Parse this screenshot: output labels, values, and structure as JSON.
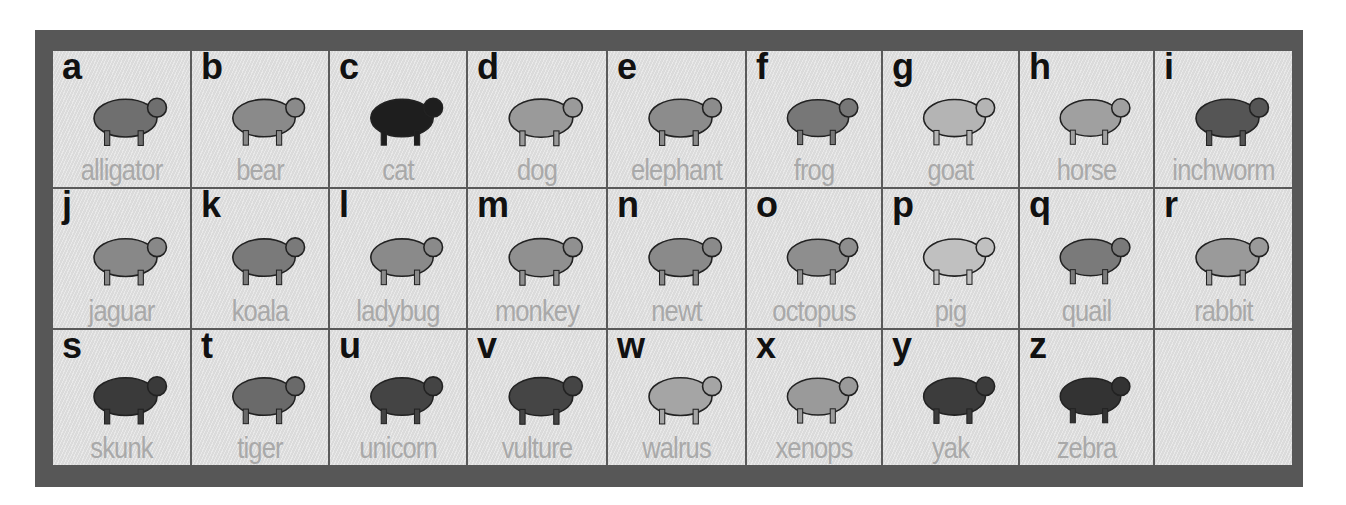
{
  "chart_title": "Animal Alphabet",
  "colors": {
    "frame": "#575757",
    "cell_background": "#e2e2e2",
    "letter": "#111111",
    "word": "#a9a9a9"
  },
  "cells": [
    {
      "letter": "a",
      "word": "alligator",
      "icon": "alligator-icon",
      "tone": "#6f6f6f"
    },
    {
      "letter": "b",
      "word": "bear",
      "icon": "bear-icon",
      "tone": "#8a8a8a"
    },
    {
      "letter": "c",
      "word": "cat",
      "icon": "cat-icon",
      "tone": "#1e1e1e"
    },
    {
      "letter": "d",
      "word": "dog",
      "icon": "dog-icon",
      "tone": "#9a9a9a"
    },
    {
      "letter": "e",
      "word": "elephant",
      "icon": "elephant-icon",
      "tone": "#8c8c8c"
    },
    {
      "letter": "f",
      "word": "frog",
      "icon": "frog-icon",
      "tone": "#777777"
    },
    {
      "letter": "g",
      "word": "goat",
      "icon": "goat-icon",
      "tone": "#b4b4b4"
    },
    {
      "letter": "h",
      "word": "horse",
      "icon": "horse-icon",
      "tone": "#a0a0a0"
    },
    {
      "letter": "i",
      "word": "inchworm",
      "icon": "inchworm-icon",
      "tone": "#555555"
    },
    {
      "letter": "j",
      "word": "jaguar",
      "icon": "jaguar-icon",
      "tone": "#888888"
    },
    {
      "letter": "k",
      "word": "koala",
      "icon": "koala-icon",
      "tone": "#7a7a7a"
    },
    {
      "letter": "l",
      "word": "ladybug",
      "icon": "ladybug-icon",
      "tone": "#8a8a8a"
    },
    {
      "letter": "m",
      "word": "monkey",
      "icon": "monkey-icon",
      "tone": "#909090"
    },
    {
      "letter": "n",
      "word": "newt",
      "icon": "newt-icon",
      "tone": "#8a8a8a"
    },
    {
      "letter": "o",
      "word": "octopus",
      "icon": "octopus-icon",
      "tone": "#8e8e8e"
    },
    {
      "letter": "p",
      "word": "pig",
      "icon": "pig-icon",
      "tone": "#c0c0c0"
    },
    {
      "letter": "q",
      "word": "quail",
      "icon": "quail-icon",
      "tone": "#7a7a7a"
    },
    {
      "letter": "r",
      "word": "rabbit",
      "icon": "rabbit-icon",
      "tone": "#9a9a9a"
    },
    {
      "letter": "s",
      "word": "skunk",
      "icon": "skunk-icon",
      "tone": "#3a3a3a"
    },
    {
      "letter": "t",
      "word": "tiger",
      "icon": "tiger-icon",
      "tone": "#6a6a6a"
    },
    {
      "letter": "u",
      "word": "unicorn",
      "icon": "unicorn-icon",
      "tone": "#444444"
    },
    {
      "letter": "v",
      "word": "vulture",
      "icon": "vulture-icon",
      "tone": "#454545"
    },
    {
      "letter": "w",
      "word": "walrus",
      "icon": "walrus-icon",
      "tone": "#a5a5a5"
    },
    {
      "letter": "x",
      "word": "xenops",
      "icon": "xenops-icon",
      "tone": "#9a9a9a"
    },
    {
      "letter": "y",
      "word": "yak",
      "icon": "yak-icon",
      "tone": "#3c3c3c"
    },
    {
      "letter": "z",
      "word": "zebra",
      "icon": "zebra-icon",
      "tone": "#333333"
    },
    {
      "letter": "",
      "word": "",
      "icon": "",
      "tone": ""
    }
  ]
}
